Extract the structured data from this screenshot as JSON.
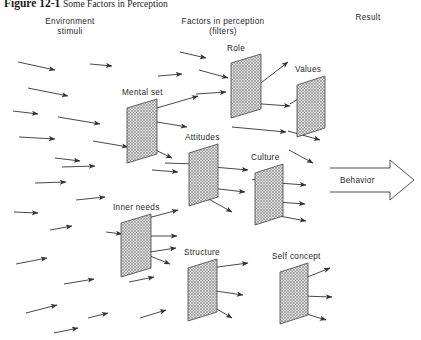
{
  "figure": {
    "number": "Figure 12-1",
    "caption": "Some Factors in Perception"
  },
  "columns": [
    {
      "name": "environment",
      "line1": "Environment",
      "line2": "stimuli",
      "x": 20,
      "y": 17,
      "w": 100
    },
    {
      "name": "filters",
      "line1": "Factors in perception",
      "line2": "(filters)",
      "x": 158,
      "y": 17,
      "w": 130
    },
    {
      "name": "result",
      "line1": "Result",
      "line2": "",
      "x": 338,
      "y": 13,
      "w": 60
    }
  ],
  "filters": [
    {
      "id": "role",
      "label": "Role",
      "label_x": 227,
      "label_y": 44,
      "px": 231,
      "py": 54,
      "pw": 30,
      "ph": 55
    },
    {
      "id": "mental-set",
      "label": "Mental set",
      "label_x": 122,
      "label_y": 88,
      "px": 127,
      "py": 99,
      "pw": 30,
      "ph": 55
    },
    {
      "id": "values",
      "label": "Values",
      "label_x": 295,
      "label_y": 65,
      "px": 297,
      "py": 76,
      "pw": 28,
      "ph": 52
    },
    {
      "id": "attitudes",
      "label": "Attitudes",
      "label_x": 185,
      "label_y": 133,
      "px": 189,
      "py": 144,
      "pw": 29,
      "ph": 53
    },
    {
      "id": "culture",
      "label": "Culture",
      "label_x": 251,
      "label_y": 153,
      "px": 255,
      "py": 164,
      "pw": 28,
      "ph": 52
    },
    {
      "id": "inner-needs",
      "label": "Inner needs",
      "label_x": 113,
      "label_y": 203,
      "px": 121,
      "py": 214,
      "pw": 30,
      "ph": 54
    },
    {
      "id": "structure",
      "label": "Structure",
      "label_x": 184,
      "label_y": 248,
      "px": 188,
      "py": 259,
      "pw": 29,
      "ph": 53
    },
    {
      "id": "self-concept",
      "label": "Self concept",
      "label_x": 272,
      "label_y": 252,
      "px": 280,
      "py": 263,
      "pw": 28,
      "ph": 52
    }
  ],
  "result": {
    "behavior_label": "Behavior",
    "behavior_label_x": 340,
    "behavior_label_y": 176
  },
  "colors": {
    "ink": "#1a1a1a",
    "arrow": "#333333",
    "panel_fill": "#d8d8d8",
    "panel_edge": "#444444",
    "hatch": "#8a8a8a",
    "behavior_edge": "#3a3a3a"
  },
  "stimulus_arrows": [
    {
      "x1": 18,
      "y1": 62,
      "x2": 55,
      "y2": 70
    },
    {
      "x1": 90,
      "y1": 64,
      "x2": 112,
      "y2": 66
    },
    {
      "x1": 28,
      "y1": 88,
      "x2": 68,
      "y2": 96
    },
    {
      "x1": 13,
      "y1": 111,
      "x2": 38,
      "y2": 114
    },
    {
      "x1": 58,
      "y1": 117,
      "x2": 100,
      "y2": 124
    },
    {
      "x1": 19,
      "y1": 137,
      "x2": 55,
      "y2": 139
    },
    {
      "x1": 93,
      "y1": 141,
      "x2": 128,
      "y2": 147
    },
    {
      "x1": 55,
      "y1": 158,
      "x2": 80,
      "y2": 161
    },
    {
      "x1": 62,
      "y1": 167,
      "x2": 95,
      "y2": 166
    },
    {
      "x1": 35,
      "y1": 183,
      "x2": 66,
      "y2": 182
    },
    {
      "x1": 76,
      "y1": 200,
      "x2": 105,
      "y2": 197
    },
    {
      "x1": 14,
      "y1": 212,
      "x2": 38,
      "y2": 213
    },
    {
      "x1": 50,
      "y1": 230,
      "x2": 72,
      "y2": 226
    },
    {
      "x1": 106,
      "y1": 232,
      "x2": 122,
      "y2": 234
    },
    {
      "x1": 16,
      "y1": 264,
      "x2": 47,
      "y2": 258
    },
    {
      "x1": 64,
      "y1": 284,
      "x2": 94,
      "y2": 279
    },
    {
      "x1": 26,
      "y1": 313,
      "x2": 57,
      "y2": 305
    },
    {
      "x1": 88,
      "y1": 318,
      "x2": 108,
      "y2": 313
    },
    {
      "x1": 54,
      "y1": 333,
      "x2": 78,
      "y2": 328
    },
    {
      "x1": 140,
      "y1": 318,
      "x2": 166,
      "y2": 310
    },
    {
      "x1": 150,
      "y1": 252,
      "x2": 176,
      "y2": 248
    },
    {
      "x1": 152,
      "y1": 170,
      "x2": 178,
      "y2": 172
    },
    {
      "x1": 158,
      "y1": 76,
      "x2": 182,
      "y2": 74
    },
    {
      "x1": 180,
      "y1": 52,
      "x2": 206,
      "y2": 58
    },
    {
      "x1": 129,
      "y1": 282,
      "x2": 154,
      "y2": 277
    }
  ],
  "filter_arrows": [
    {
      "x1": 199,
      "y1": 70,
      "x2": 228,
      "y2": 78
    },
    {
      "x1": 196,
      "y1": 94,
      "x2": 226,
      "y2": 92
    },
    {
      "x1": 257,
      "y1": 86,
      "x2": 288,
      "y2": 62
    },
    {
      "x1": 248,
      "y1": 103,
      "x2": 290,
      "y2": 106
    },
    {
      "x1": 232,
      "y1": 127,
      "x2": 286,
      "y2": 132
    },
    {
      "x1": 150,
      "y1": 110,
      "x2": 198,
      "y2": 96
    },
    {
      "x1": 145,
      "y1": 120,
      "x2": 187,
      "y2": 127
    },
    {
      "x1": 141,
      "y1": 143,
      "x2": 172,
      "y2": 158
    },
    {
      "x1": 290,
      "y1": 104,
      "x2": 321,
      "y2": 84
    },
    {
      "x1": 288,
      "y1": 131,
      "x2": 320,
      "y2": 140
    },
    {
      "x1": 289,
      "y1": 150,
      "x2": 313,
      "y2": 163
    },
    {
      "x1": 165,
      "y1": 163,
      "x2": 196,
      "y2": 164
    },
    {
      "x1": 213,
      "y1": 167,
      "x2": 248,
      "y2": 170
    },
    {
      "x1": 210,
      "y1": 188,
      "x2": 245,
      "y2": 192
    },
    {
      "x1": 203,
      "y1": 196,
      "x2": 232,
      "y2": 212
    },
    {
      "x1": 252,
      "y1": 180,
      "x2": 283,
      "y2": 170
    },
    {
      "x1": 278,
      "y1": 183,
      "x2": 306,
      "y2": 185
    },
    {
      "x1": 277,
      "y1": 202,
      "x2": 305,
      "y2": 204
    },
    {
      "x1": 274,
      "y1": 215,
      "x2": 306,
      "y2": 221
    },
    {
      "x1": 148,
      "y1": 218,
      "x2": 178,
      "y2": 210
    },
    {
      "x1": 141,
      "y1": 236,
      "x2": 177,
      "y2": 236
    },
    {
      "x1": 140,
      "y1": 252,
      "x2": 170,
      "y2": 264
    },
    {
      "x1": 210,
      "y1": 268,
      "x2": 248,
      "y2": 263
    },
    {
      "x1": 209,
      "y1": 290,
      "x2": 243,
      "y2": 295
    },
    {
      "x1": 202,
      "y1": 300,
      "x2": 232,
      "y2": 318
    },
    {
      "x1": 300,
      "y1": 280,
      "x2": 330,
      "y2": 268
    },
    {
      "x1": 302,
      "y1": 296,
      "x2": 332,
      "y2": 297
    },
    {
      "x1": 300,
      "y1": 312,
      "x2": 326,
      "y2": 320
    }
  ]
}
